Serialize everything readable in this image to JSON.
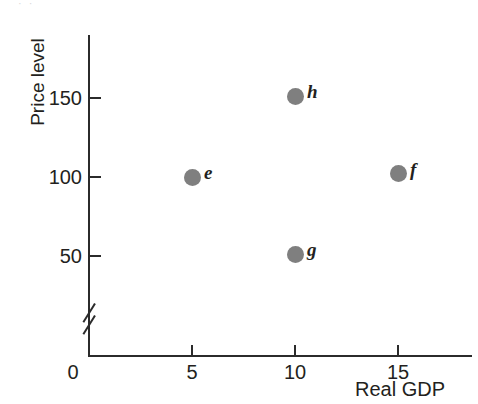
{
  "figure": {
    "scan_artifact_text": "· ·",
    "background_color": "#ffffff",
    "ink_color": "#231f20",
    "point_color": "#7f7f7f"
  },
  "chart_data": {
    "type": "scatter",
    "title": "",
    "xlabel": "Real GDP",
    "ylabel": "Price level",
    "xlim": [
      0,
      17.5
    ],
    "ylim": [
      0,
      190
    ],
    "grid": false,
    "legend": "none",
    "y_axis_break": true,
    "xticks": [
      0,
      5,
      10,
      15
    ],
    "xticklabels": [
      "0",
      "5",
      "10",
      "15"
    ],
    "yticks": [
      50,
      100,
      150
    ],
    "yticklabels": [
      "50",
      "100",
      "150"
    ],
    "points": [
      {
        "label": "e",
        "x": 5,
        "y": 100
      },
      {
        "label": "f",
        "x": 15,
        "y": 102
      },
      {
        "label": "g",
        "x": 10,
        "y": 51
      },
      {
        "label": "h",
        "x": 10,
        "y": 151
      }
    ]
  }
}
